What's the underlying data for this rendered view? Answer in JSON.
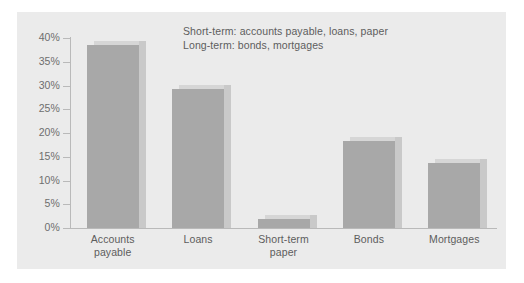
{
  "chart_data": {
    "type": "bar",
    "title": "",
    "subtitle": "",
    "xlabel": "",
    "ylabel": "",
    "categories": [
      "Accounts payable",
      "Loans",
      "Short-term paper",
      "Bonds",
      "Mortgages"
    ],
    "category_lines": [
      [
        "Accounts",
        "payable"
      ],
      [
        "Loans"
      ],
      [
        "Short-term",
        "paper"
      ],
      [
        "Bonds"
      ],
      [
        "Mortgages"
      ]
    ],
    "values": [
      38.5,
      29.3,
      2.0,
      18.3,
      13.7
    ],
    "value_labels": [
      "38.5%",
      "29.3%",
      "2.0%",
      "18.3%",
      "13.7%"
    ],
    "ylim": [
      0,
      40
    ],
    "ytick_values": [
      40,
      35,
      30,
      25,
      20,
      15,
      10,
      5,
      0
    ],
    "ytick_labels": [
      "40%",
      "35%",
      "30%",
      "25%",
      "20%",
      "15%",
      "10%",
      "5%",
      "0%"
    ],
    "grid": false,
    "legend_position": "none",
    "annotations": [
      "Short-term: accounts payable, loans, paper",
      "Long-term: bonds, mortgages"
    ],
    "colors": {
      "panel_background": "#ebebeb",
      "figure_background": "#ffffff",
      "bar_face": "#a8a8a8",
      "bar_side": "#c9c9c9",
      "bar_top": "#d6d6d6",
      "axis": "#b9b9b9",
      "tick_text": "#6e6e6e",
      "label_text": "#5d5d5d"
    }
  }
}
